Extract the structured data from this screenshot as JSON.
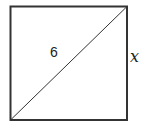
{
  "figure": {
    "shape": "square",
    "diagonal_label": "6",
    "side_label": "x",
    "stroke_color": "#333333"
  }
}
